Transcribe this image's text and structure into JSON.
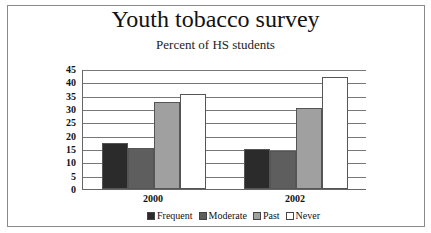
{
  "chart_data": {
    "type": "bar",
    "title": "Youth tobacco survey",
    "subtitle": "Percent of HS students",
    "xlabel": "",
    "ylabel": "",
    "categories": [
      "2000",
      "2002"
    ],
    "series": [
      {
        "name": "Frequent",
        "color": "#2b2b2b",
        "values": [
          17.2,
          15.0
        ]
      },
      {
        "name": "Moderate",
        "color": "#5e5e5e",
        "values": [
          15.5,
          14.3
        ]
      },
      {
        "name": "Past",
        "color": "#a0a0a0",
        "values": [
          32.7,
          30.4
        ]
      },
      {
        "name": "Never",
        "color": "#ffffff",
        "values": [
          35.7,
          42.1
        ]
      }
    ],
    "ylim": [
      0,
      45
    ],
    "yticks": [
      0,
      5,
      10,
      15,
      20,
      25,
      30,
      35,
      40,
      45
    ],
    "grid": true,
    "legend_position": "bottom"
  },
  "legend": {
    "items": [
      "Frequent",
      "Moderate",
      "Past",
      "Never"
    ]
  }
}
